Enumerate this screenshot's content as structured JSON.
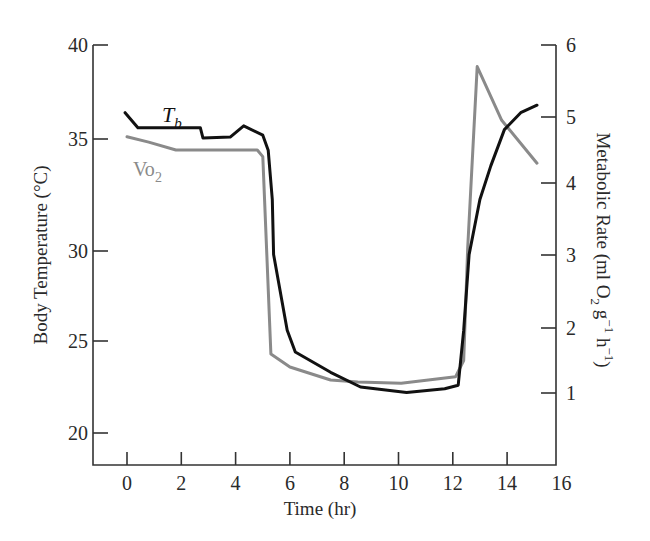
{
  "chart_data": {
    "type": "line",
    "title": "",
    "xlabel": "Time (hr)",
    "ylabel": "Body Temperature (°C)",
    "y2label": "Metabolic Rate (ml O2 g-1 h-1)",
    "xlim": [
      -1.3,
      16
    ],
    "ylim": [
      18.3,
      40
    ],
    "y2lim": [
      0,
      6
    ],
    "x_ticks": [
      0,
      2,
      4,
      6,
      8,
      10,
      12,
      14,
      16
    ],
    "y_ticks": [
      20,
      25,
      30,
      35,
      40
    ],
    "y2_ticks": [
      1,
      2,
      3,
      4,
      5,
      6
    ],
    "grid": false,
    "legend": "inline labels",
    "series": [
      {
        "name": "Tb",
        "axis": "left",
        "color": "#111111",
        "x": [
          -0.07,
          0.4,
          1.5,
          2.7,
          2.8,
          3.8,
          4.3,
          5.0,
          5.2,
          5.35,
          5.4,
          5.9,
          6.2,
          7.5,
          8.6,
          10.3,
          11.7,
          12.2,
          12.4,
          12.6,
          13.0,
          13.4,
          13.9,
          14.5,
          15.1
        ],
        "values": [
          36.4,
          35.6,
          35.6,
          35.6,
          35.05,
          35.1,
          35.7,
          35.2,
          34.5,
          32.3,
          29.8,
          25.6,
          24.4,
          23.3,
          22.5,
          22.2,
          22.4,
          22.6,
          25.6,
          29.8,
          32.3,
          33.8,
          35.5,
          36.4,
          36.8
        ]
      },
      {
        "name": "VO2",
        "axis": "right",
        "color": "#8a8a8a",
        "x": [
          0.0,
          0.8,
          1.8,
          2.7,
          4.8,
          5.0,
          5.3,
          6.0,
          7.5,
          8.5,
          10.1,
          12.1,
          12.4,
          12.55,
          12.9,
          13.8,
          15.1
        ],
        "values": [
          4.7,
          4.62,
          4.5,
          4.5,
          4.5,
          4.4,
          1.6,
          1.4,
          1.2,
          1.17,
          1.15,
          1.25,
          1.5,
          3.1,
          5.7,
          4.95,
          4.3
        ]
      }
    ],
    "annotations": [
      {
        "text": "Tb",
        "near": "Tb series start"
      },
      {
        "text": "VO2",
        "near": "VO2 series start"
      }
    ]
  },
  "labels": {
    "x_axis_title": "Time (hr)",
    "y_axis_title": "Body Temperature (°C)",
    "y2_axis_title_main": "Metabolic Rate (ml O",
    "y2_axis_title_sub2": "2",
    "y2_axis_title_g": " g",
    "y2_axis_title_sup1": "−1",
    "y2_axis_title_h": " h",
    "y2_axis_title_sup2": "−1",
    "y2_axis_title_close": ")",
    "tb_label_main": "T",
    "tb_label_sub": "b",
    "vo2_label_main": "Vo",
    "vo2_label_sub": "2"
  }
}
